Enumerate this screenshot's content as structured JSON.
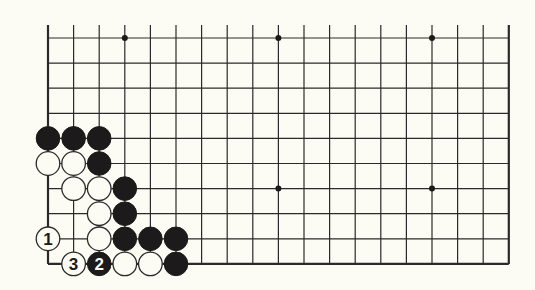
{
  "diagram": {
    "type": "go-board-partial",
    "colors": {
      "background": "#fcfcf4",
      "line": "#2a2a2a",
      "black_stone": "#1c1a1a",
      "white_stone": "#fcfcf4"
    },
    "grid": {
      "columns": 19,
      "rows": 10,
      "x0": 48,
      "dx": 25.6,
      "y0": 38,
      "dy": 25.1,
      "top_extension": 13,
      "edges": [
        "left",
        "right",
        "bottom"
      ]
    },
    "star_points": [
      {
        "col": 3,
        "row": 0
      },
      {
        "col": 9,
        "row": 0
      },
      {
        "col": 15,
        "row": 0
      },
      {
        "col": 9,
        "row": 6
      },
      {
        "col": 15,
        "row": 6
      }
    ],
    "stones": [
      {
        "color": "black",
        "col": 0,
        "row": 4
      },
      {
        "color": "black",
        "col": 1,
        "row": 4
      },
      {
        "color": "black",
        "col": 2,
        "row": 4
      },
      {
        "color": "white",
        "col": 0,
        "row": 5
      },
      {
        "color": "white",
        "col": 1,
        "row": 5
      },
      {
        "color": "black",
        "col": 2,
        "row": 5
      },
      {
        "color": "white",
        "col": 1,
        "row": 6
      },
      {
        "color": "white",
        "col": 2,
        "row": 6
      },
      {
        "color": "black",
        "col": 3,
        "row": 6
      },
      {
        "color": "white",
        "col": 2,
        "row": 7
      },
      {
        "color": "black",
        "col": 3,
        "row": 7
      },
      {
        "color": "white",
        "col": 0,
        "row": 8,
        "label": "1"
      },
      {
        "color": "white",
        "col": 2,
        "row": 8
      },
      {
        "color": "black",
        "col": 3,
        "row": 8
      },
      {
        "color": "black",
        "col": 4,
        "row": 8
      },
      {
        "color": "black",
        "col": 5,
        "row": 8
      },
      {
        "color": "white",
        "col": 1,
        "row": 9,
        "label": "3"
      },
      {
        "color": "black",
        "col": 2,
        "row": 9,
        "label": "2"
      },
      {
        "color": "white",
        "col": 3,
        "row": 9
      },
      {
        "color": "white",
        "col": 4,
        "row": 9
      },
      {
        "color": "black",
        "col": 5,
        "row": 9
      }
    ],
    "move_labels": [
      "1",
      "2",
      "3"
    ]
  }
}
